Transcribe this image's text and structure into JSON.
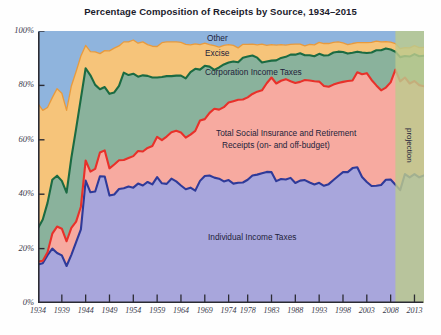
{
  "chart_data": {
    "type": "area",
    "title": "Percentage Composition of Receipts by Source, 1934–2015",
    "xlabel": "",
    "ylabel": "",
    "ylim": [
      0,
      100
    ],
    "xlim": [
      1934,
      2015
    ],
    "grid": false,
    "legend_position": "inline-annotations",
    "stacked": true,
    "y_ticks": [
      "0%",
      "20%",
      "40%",
      "60%",
      "80%",
      "100%"
    ],
    "y_tick_values": [
      0,
      20,
      40,
      60,
      80,
      100
    ],
    "x_ticks": [
      "1934",
      "1939",
      "1944",
      "1949",
      "1954",
      "1959",
      "1964",
      "1969",
      "1974",
      "1978",
      "1983",
      "1988",
      "1993",
      "1998",
      "2003",
      "2008",
      "2013"
    ],
    "x_tick_values": [
      1934,
      1939,
      1944,
      1949,
      1954,
      1959,
      1964,
      1969,
      1974,
      1978,
      1983,
      1988,
      1993,
      1998,
      2003,
      2008,
      2013
    ],
    "annotations": [
      {
        "text": "Other",
        "x": 1968,
        "y": 97
      },
      {
        "text": "Excise",
        "x": 1966,
        "y": 91
      },
      {
        "text": "Corporation Income Taxes",
        "x": 1964,
        "y": 83
      },
      {
        "text": "Total Social Insurance and Retirement",
        "x": 1986,
        "y": 60
      },
      {
        "text": "Receipts (on- and off-budget)",
        "x": 1986,
        "y": 55
      },
      {
        "text": "Individual Income Taxes",
        "x": 1982,
        "y": 24
      },
      {
        "text": "projection",
        "x": 2012,
        "y": 55
      }
    ],
    "projection_start_year": 2009,
    "projection_end_year": 2015,
    "projection_band_color": "#bcca8e",
    "years": [
      1934,
      1935,
      1936,
      1937,
      1938,
      1939,
      1940,
      1941,
      1942,
      1943,
      1944,
      1945,
      1946,
      1947,
      1948,
      1949,
      1950,
      1951,
      1952,
      1953,
      1954,
      1955,
      1956,
      1957,
      1958,
      1959,
      1960,
      1961,
      1962,
      1963,
      1964,
      1965,
      1966,
      1967,
      1968,
      1969,
      1970,
      1971,
      1972,
      1973,
      1974,
      1975,
      1976,
      1977,
      1978,
      1979,
      1980,
      1981,
      1982,
      1983,
      1984,
      1985,
      1986,
      1987,
      1988,
      1989,
      1990,
      1991,
      1992,
      1993,
      1994,
      1995,
      1996,
      1997,
      1998,
      1999,
      2000,
      2001,
      2002,
      2003,
      2004,
      2005,
      2006,
      2007,
      2008,
      2009,
      2010,
      2011,
      2012,
      2013,
      2014,
      2015
    ],
    "series": [
      {
        "name": "Individual Income Taxes",
        "fill_color": "#a8a6dc",
        "line_color": "#2f3a99",
        "values": [
          14.2,
          14.6,
          17.6,
          20.0,
          18.4,
          17.5,
          13.6,
          17.7,
          22.4,
          27.1,
          45.0,
          40.7,
          41.0,
          46.6,
          46.5,
          39.5,
          39.9,
          41.9,
          42.2,
          42.8,
          42.4,
          43.9,
          43.2,
          44.5,
          43.6,
          46.3,
          44.0,
          43.8,
          45.7,
          44.7,
          43.2,
          41.8,
          42.4,
          41.3,
          44.9,
          46.7,
          46.9,
          46.1,
          45.7,
          44.7,
          45.2,
          43.9,
          44.2,
          44.3,
          45.3,
          47.0,
          47.2,
          47.7,
          48.2,
          48.1,
          44.8,
          45.6,
          45.4,
          46.0,
          44.1,
          45.0,
          45.2,
          44.3,
          43.6,
          44.2,
          43.1,
          43.7,
          45.2,
          46.7,
          48.1,
          48.1,
          49.6,
          49.9,
          46.3,
          44.5,
          43.0,
          43.1,
          43.4,
          45.3,
          45.4,
          43.5,
          41.5,
          47.4,
          46.2,
          47.4,
          46.2,
          46.9
        ]
      },
      {
        "name": "Total Social Insurance and Retirement Receipts (on- and off-budget)",
        "fill_color": "#f7aaa0",
        "line_color": "#e8312a",
        "values": [
          1.0,
          0.9,
          1.1,
          5.5,
          9.7,
          9.8,
          9.1,
          9.9,
          7.5,
          8.3,
          7.4,
          7.6,
          8.3,
          8.7,
          9.6,
          10.0,
          11.0,
          10.6,
          10.4,
          10.5,
          11.6,
          12.0,
          12.5,
          12.5,
          14.1,
          14.8,
          15.9,
          17.4,
          17.1,
          18.6,
          19.5,
          19.0,
          19.5,
          22.0,
          22.2,
          20.9,
          23.0,
          25.3,
          25.4,
          27.3,
          28.5,
          30.3,
          30.5,
          30.5,
          30.3,
          30.0,
          30.5,
          30.5,
          32.6,
          34.8,
          35.9,
          36.1,
          36.9,
          35.5,
          36.8,
          36.3,
          36.8,
          37.5,
          37.9,
          37.2,
          36.7,
          35.8,
          35.1,
          34.2,
          33.2,
          33.5,
          32.2,
          34.9,
          37.8,
          40.0,
          39.0,
          36.9,
          34.8,
          33.9,
          35.7,
          42.3,
          40.0,
          35.5,
          34.5,
          34.2,
          33.9,
          32.8
        ]
      },
      {
        "name": "Corporation Income Taxes",
        "fill_color": "#8ab29c",
        "line_color": "#1b6b42",
        "values": [
          12.3,
          15.2,
          18.1,
          19.8,
          18.7,
          17.6,
          17.9,
          25.8,
          34.2,
          39.8,
          33.9,
          35.4,
          30.9,
          23.3,
          23.3,
          27.4,
          26.5,
          27.3,
          32.1,
          30.5,
          30.3,
          27.3,
          28.0,
          26.5,
          25.2,
          21.8,
          23.2,
          22.2,
          20.6,
          20.3,
          20.9,
          21.8,
          23.0,
          22.8,
          18.7,
          19.6,
          17.0,
          14.3,
          15.5,
          15.7,
          14.7,
          14.6,
          13.8,
          15.4,
          15.0,
          14.2,
          12.5,
          10.2,
          8.0,
          6.2,
          8.5,
          8.4,
          8.2,
          9.8,
          10.4,
          10.5,
          9.1,
          9.3,
          9.2,
          10.2,
          11.2,
          11.6,
          11.8,
          11.5,
          11.0,
          10.1,
          10.2,
          7.6,
          8.0,
          7.4,
          10.1,
          12.9,
          14.7,
          14.4,
          12.1,
          6.6,
          8.9,
          7.9,
          9.9,
          9.9,
          10.6,
          11.2
        ]
      },
      {
        "name": "Excise",
        "fill_color": "#f6c47a",
        "line_color": "#e89a3c",
        "values": [
          45.8,
          40.1,
          35.1,
          30.2,
          32.0,
          32.2,
          30.2,
          26.4,
          21.0,
          15.6,
          8.4,
          8.7,
          12.1,
          13.1,
          13.4,
          15.8,
          16.3,
          14.7,
          11.3,
          12.2,
          12.4,
          12.3,
          12.3,
          11.5,
          11.5,
          11.4,
          12.6,
          12.6,
          12.6,
          12.4,
          12.2,
          12.5,
          10.0,
          9.2,
          9.2,
          8.3,
          8.1,
          8.9,
          7.5,
          7.0,
          6.6,
          5.9,
          5.3,
          4.9,
          4.5,
          4.2,
          4.7,
          6.8,
          5.9,
          5.9,
          5.6,
          4.9,
          4.3,
          3.8,
          3.9,
          3.4,
          3.4,
          4.0,
          4.2,
          4.2,
          4.4,
          4.3,
          3.7,
          3.6,
          3.3,
          3.3,
          3.4,
          3.3,
          3.6,
          3.8,
          3.7,
          3.4,
          3.1,
          2.5,
          2.7,
          3.0,
          3.1,
          3.1,
          3.2,
          3.1,
          3.2,
          3.1
        ]
      },
      {
        "name": "Other",
        "fill_color": "#8fb4dd",
        "line_color": "#7aa3d4",
        "values": [
          26.7,
          29.2,
          28.1,
          24.5,
          21.2,
          22.9,
          29.2,
          20.2,
          14.9,
          9.2,
          5.3,
          7.6,
          7.7,
          8.3,
          7.2,
          7.3,
          6.3,
          5.5,
          4.0,
          4.0,
          3.3,
          4.5,
          4.0,
          5.0,
          5.6,
          5.7,
          4.3,
          4.0,
          4.0,
          4.0,
          4.2,
          4.9,
          5.1,
          4.7,
          5.0,
          4.5,
          5.0,
          5.4,
          5.9,
          5.3,
          5.0,
          5.3,
          6.2,
          4.9,
          4.9,
          4.8,
          5.1,
          4.8,
          5.3,
          5.0,
          5.2,
          5.0,
          5.2,
          4.9,
          4.8,
          4.8,
          5.5,
          4.9,
          5.1,
          4.2,
          4.6,
          4.6,
          4.2,
          4.0,
          4.4,
          5.0,
          4.6,
          4.3,
          4.3,
          4.3,
          4.2,
          3.7,
          4.0,
          3.9,
          4.1,
          4.6,
          6.5,
          6.1,
          6.2,
          5.4,
          6.1,
          6.0
        ]
      }
    ]
  },
  "axes": {
    "y_label_0": "0%",
    "y_label_20": "20%",
    "y_label_40": "40%",
    "y_label_60": "60%",
    "y_label_80": "80%",
    "y_label_100": "100%"
  },
  "labels": {
    "other": "Other",
    "excise": "Excise",
    "corporation": "Corporation Income Taxes",
    "social_line1": "Total Social Insurance and Retirement",
    "social_line2": "Receipts (on- and off-budget)",
    "individual": "Individual Income Taxes",
    "projection": "projection"
  }
}
